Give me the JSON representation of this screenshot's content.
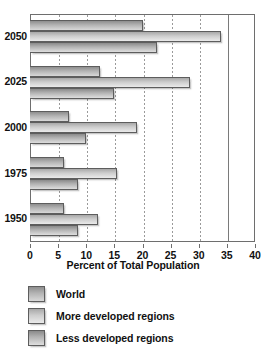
{
  "chart_data": {
    "type": "bar",
    "orientation": "horizontal",
    "title": "",
    "xlabel": "Percent of Total Population",
    "ylabel": "",
    "xlim": [
      0,
      40
    ],
    "ylim": null,
    "grid": true,
    "legend_position": "bottom-left",
    "categories": [
      "1950",
      "1975",
      "2000",
      "2025",
      "2050"
    ],
    "xticks": [
      0,
      5,
      10,
      15,
      20,
      25,
      30,
      35,
      40
    ],
    "xtick_labels": [
      "0",
      "5",
      "10",
      "15",
      "20",
      "25",
      "30",
      "35",
      "40"
    ],
    "series": [
      {
        "name": "World",
        "values": [
          6.0,
          6.0,
          7.0,
          12.5,
          20.0
        ]
      },
      {
        "name": "More developed regions",
        "values": [
          12.0,
          15.5,
          19.0,
          28.5,
          34.0
        ]
      },
      {
        "name": "Less developed regions",
        "values": [
          8.5,
          8.5,
          10.0,
          15.0,
          22.5
        ]
      }
    ]
  },
  "legend": {
    "items": [
      {
        "label": "World",
        "swatch": "legend-swatch-world"
      },
      {
        "label": "More developed regions",
        "swatch": "legend-swatch-more-developed"
      },
      {
        "label": "Less developed regions",
        "swatch": "legend-swatch-less-developed"
      }
    ]
  },
  "axis": {
    "x_title": "Percent of Total Population"
  }
}
